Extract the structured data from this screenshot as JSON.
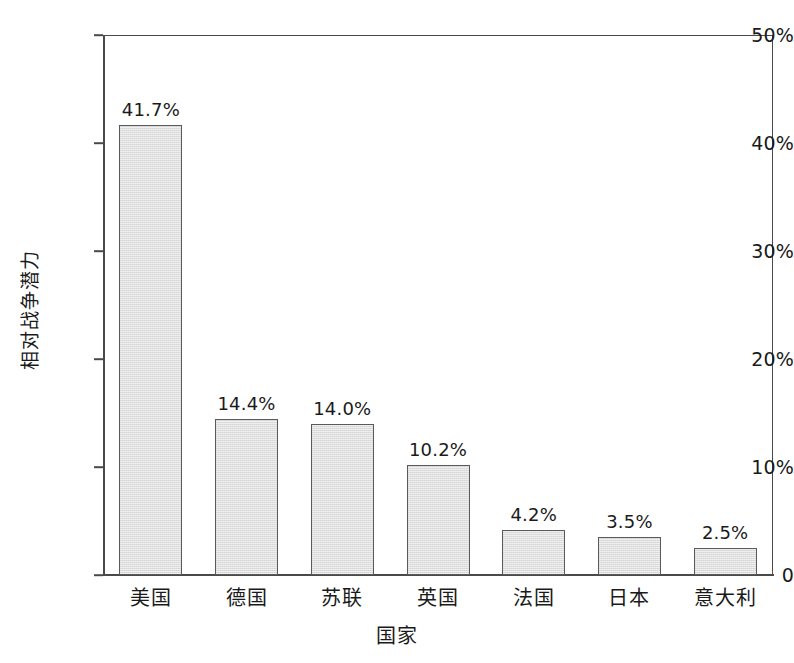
{
  "chart_data": {
    "type": "bar",
    "title": "",
    "subtitle": "",
    "xlabel": "国家",
    "ylabel": "相对战争潜力",
    "categories": [
      "美国",
      "德国",
      "苏联",
      "英国",
      "法国",
      "日本",
      "意大利"
    ],
    "values": [
      41.7,
      14.4,
      14.0,
      10.2,
      4.2,
      3.5,
      2.5
    ],
    "value_labels": [
      "41.7%",
      "14.4%",
      "14.0%",
      "10.2%",
      "4.2%",
      "3.5%",
      "2.5%"
    ],
    "ylim": [
      0,
      50
    ],
    "ytick_values": [
      0,
      10,
      20,
      30,
      40,
      50
    ],
    "ytick_labels": [
      "0",
      "10%",
      "20%",
      "30%",
      "40%",
      "50%"
    ],
    "grid": false,
    "legend": null,
    "legend_position": "none",
    "series": [
      {
        "name": "相对战争潜力",
        "values": [
          41.7,
          14.4,
          14.0,
          10.2,
          4.2,
          3.5,
          2.5
        ]
      }
    ],
    "colors": {
      "bar_fill": "#dedede",
      "bar_border": "#5a5a5a",
      "axis": "#4a4a4a",
      "text": "#1a1a1a",
      "background": "#ffffff"
    }
  }
}
